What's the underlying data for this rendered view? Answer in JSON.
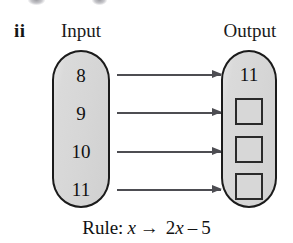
{
  "item": {
    "label": "ii"
  },
  "headings": {
    "input": "Input",
    "output": "Output"
  },
  "machine": {
    "input_values": [
      "8",
      "9",
      "10",
      "11"
    ],
    "output_values": [
      "11",
      "",
      "",
      ""
    ],
    "output_filled_count": 1,
    "output_blank_count": 3,
    "arrow_count": 4
  },
  "rule": {
    "prefix": "Rule:",
    "input_var": "x",
    "arrow": "→",
    "expression_coefficient": "2",
    "expression_var": "x",
    "expression_operator": "–",
    "expression_constant": "5",
    "full_text": "Rule: x → 2x – 5"
  },
  "colors": {
    "pill_fill": "#d6d6d6",
    "pill_stroke": "#1b1b1b",
    "box_fill": "#d7d7d7",
    "box_stroke": "#2a2a2a",
    "arrow": "#4d4d52",
    "text": "#121212",
    "background": "#ffffff"
  }
}
